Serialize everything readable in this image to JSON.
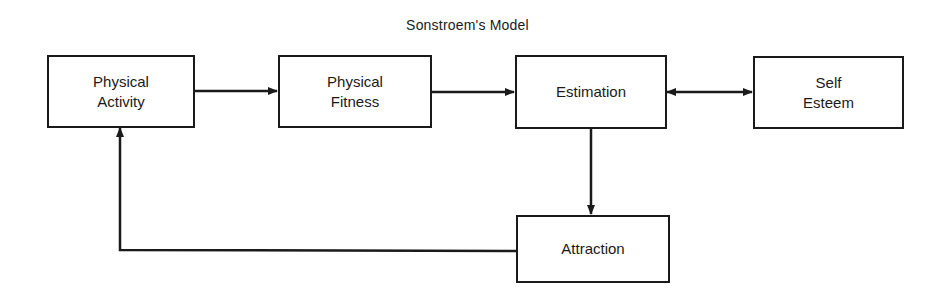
{
  "diagram": {
    "title": "Sonstroem's Model",
    "nodes": {
      "physical_activity": {
        "line1": "Physical",
        "line2": "Activity"
      },
      "physical_fitness": {
        "line1": "Physical",
        "line2": "Fitness"
      },
      "estimation": {
        "line1": "Estimation"
      },
      "self_esteem": {
        "line1": "Self",
        "line2": "Esteem"
      },
      "attraction": {
        "line1": "Attraction"
      }
    },
    "edges": [
      {
        "from": "Physical Activity",
        "to": "Physical Fitness",
        "type": "directed"
      },
      {
        "from": "Physical Fitness",
        "to": "Estimation",
        "type": "directed"
      },
      {
        "from": "Estimation",
        "to": "Self Esteem",
        "type": "bidirectional"
      },
      {
        "from": "Estimation",
        "to": "Attraction",
        "type": "directed"
      },
      {
        "from": "Attraction",
        "to": "Physical Activity",
        "type": "directed"
      }
    ],
    "line_color": "#1a1a1a"
  }
}
